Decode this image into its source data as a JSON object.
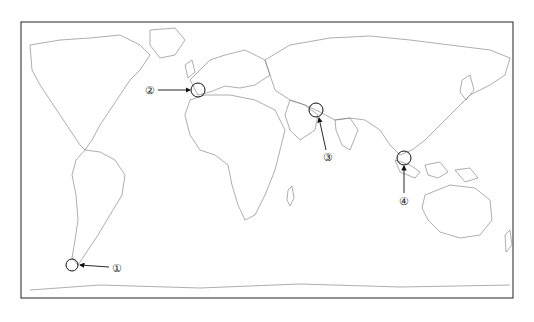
{
  "map": {
    "type": "world outline map",
    "frame": {
      "x": 21,
      "y": 22,
      "w": 492,
      "h": 276
    },
    "markers": [
      {
        "id": 1,
        "label": "①",
        "circle": {
          "cx": 72,
          "cy": 265,
          "r": 6
        },
        "label_pos": {
          "x": 117,
          "y": 268
        },
        "arrow_from": {
          "x": 109,
          "y": 267
        },
        "arrow_to": {
          "x": 80,
          "y": 265
        }
      },
      {
        "id": 2,
        "label": "②",
        "circle": {
          "cx": 198,
          "cy": 90,
          "r": 7
        },
        "label_pos": {
          "x": 150,
          "y": 90
        },
        "arrow_from": {
          "x": 158,
          "y": 90
        },
        "arrow_to": {
          "x": 190,
          "y": 90
        }
      },
      {
        "id": 3,
        "label": "③",
        "circle": {
          "cx": 316,
          "cy": 110,
          "r": 7
        },
        "label_pos": {
          "x": 328,
          "y": 157
        },
        "arrow_from": {
          "x": 326,
          "y": 150
        },
        "arrow_to": {
          "x": 319,
          "y": 118
        }
      },
      {
        "id": 4,
        "label": "④",
        "circle": {
          "cx": 404,
          "cy": 158,
          "r": 7
        },
        "label_pos": {
          "x": 404,
          "y": 201
        },
        "arrow_from": {
          "x": 404,
          "y": 193
        },
        "arrow_to": {
          "x": 404,
          "y": 166
        }
      }
    ]
  }
}
